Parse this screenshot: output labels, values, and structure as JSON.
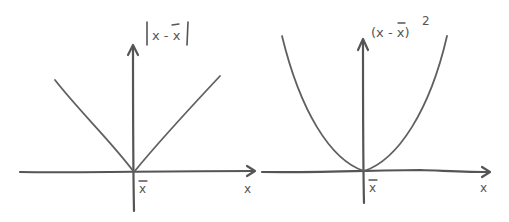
{
  "panels": [
    {
      "id": "absolute-deviation",
      "y_label": "|x - x̄|",
      "x_label": "x",
      "origin_label": "x̄",
      "curve_type": "absolute value (V-shape)"
    },
    {
      "id": "squared-deviation",
      "y_label": "(x - x̄)",
      "y_label_exponent": "2",
      "x_label": "x",
      "origin_label": "x̄",
      "curve_type": "parabola"
    }
  ],
  "colors": {
    "ink": "#555555",
    "background": "#ffffff"
  }
}
